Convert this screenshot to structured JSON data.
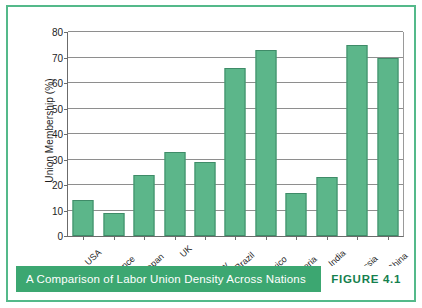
{
  "figure": {
    "caption": "A Comparison of Labor Union Density Across Nations",
    "number_label": "FIGURE 4.1",
    "frame_color": "#54b98a",
    "caption_bar_color": "#3ca771",
    "caption_text_color": "#ffffff",
    "figure_number_color": "#15804e"
  },
  "chart_data": {
    "type": "bar",
    "title": "A Comparison of Labor Union Density Across Nations",
    "xlabel": "",
    "ylabel": "Union Membership (%)",
    "ylim": [
      0,
      80
    ],
    "ytick_step": 10,
    "yticks": [
      0,
      10,
      20,
      30,
      40,
      50,
      60,
      70,
      80
    ],
    "ytick_labels": [
      "0",
      "10",
      "20",
      "30",
      "40",
      "50",
      "60",
      "70",
      "80"
    ],
    "grid": true,
    "grid_axis": "y",
    "legend": false,
    "legend_position": "none",
    "bar_color": "#5cb68a",
    "bar_edge_color": "#3f8b68",
    "categories": [
      "USA",
      "France",
      "Japan",
      "UK",
      "Germany",
      "Brazil",
      "Mexico",
      "Nigeria",
      "India",
      "Russia",
      "China"
    ],
    "values": [
      14,
      9,
      24,
      33,
      29,
      66,
      73,
      17,
      23,
      75,
      70
    ]
  }
}
